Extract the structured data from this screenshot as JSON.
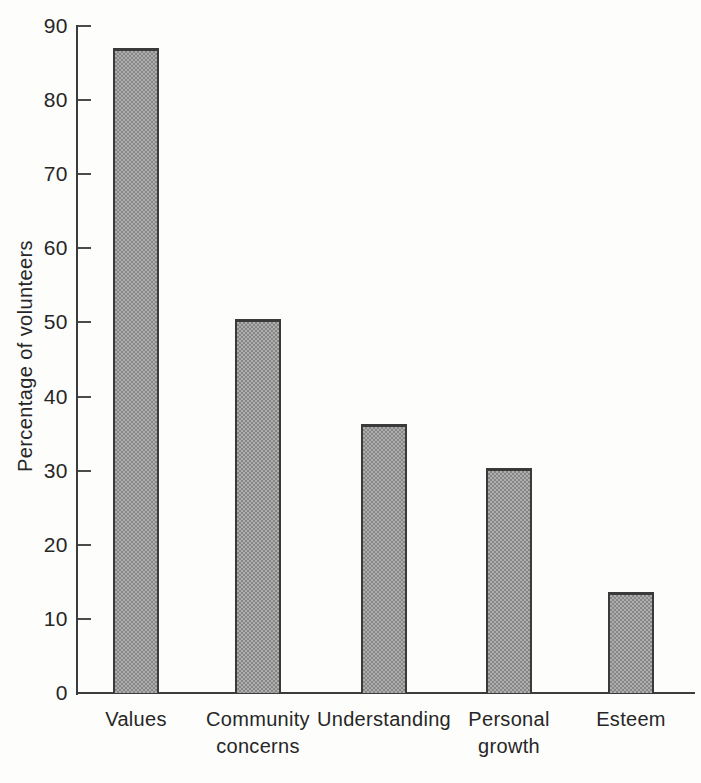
{
  "figure": {
    "background": "#fdfdfc"
  },
  "chart_data": {
    "type": "bar",
    "title": "",
    "xlabel": "",
    "ylabel": "Percentage of volunteers",
    "categories": [
      "Values",
      "Community\nconcerns",
      "Understanding",
      "Personal\ngrowth",
      "Esteem"
    ],
    "values": [
      87,
      50.5,
      36.3,
      30.3,
      13.6
    ],
    "values_unit": "percent",
    "ylim": [
      0,
      90
    ],
    "ytick_step": 10,
    "ytick_labels": [
      "0",
      "10",
      "20",
      "30",
      "40",
      "50",
      "60",
      "70",
      "80",
      "90"
    ],
    "grid": false,
    "legend": null,
    "bar_texture": "halftone-stipple",
    "colors": {
      "axis": "#3c3c3c",
      "text": "#262626",
      "bar_fill": "#aeaeae",
      "bar_dot": "#868686",
      "bar_border": "#3a3a3a",
      "background": "#fdfdfc"
    }
  }
}
